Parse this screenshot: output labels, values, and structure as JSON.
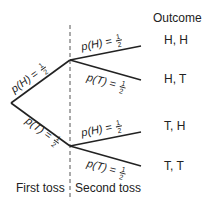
{
  "diagram": {
    "type": "probability-tree",
    "header": {
      "outcome_label": "Outcome"
    },
    "footer": {
      "first_toss_label": "First toss",
      "second_toss_label": "Second toss"
    },
    "first_level": [
      {
        "id": "H",
        "prob_var": "p(H)",
        "equals": "=",
        "num": "1",
        "den": "2"
      },
      {
        "id": "T",
        "prob_var": "p(T)",
        "equals": "=",
        "num": "1",
        "den": "2"
      }
    ],
    "second_level": [
      {
        "parent": "H",
        "prob_var": "p(H)",
        "equals": "=",
        "num": "1",
        "den": "2",
        "outcome": "H, H"
      },
      {
        "parent": "H",
        "prob_var": "p(T)",
        "equals": "=",
        "num": "1",
        "den": "2",
        "outcome": "H, T"
      },
      {
        "parent": "T",
        "prob_var": "p(H)",
        "equals": "=",
        "num": "1",
        "den": "2",
        "outcome": "T, H"
      },
      {
        "parent": "T",
        "prob_var": "p(T)",
        "equals": "=",
        "num": "1",
        "den": "2",
        "outcome": "T, T"
      }
    ],
    "colors": {
      "line": "#222222",
      "divider": "#555555",
      "background": "#ffffff"
    }
  }
}
